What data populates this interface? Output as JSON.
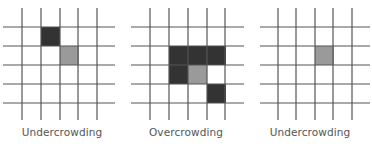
{
  "colors": {
    "grid_line": "#555555",
    "live_cell": "#333333",
    "focus_cell": "#9a9a9a",
    "background": "#ffffff",
    "caption": "#555555"
  },
  "grid": {
    "rows": 5,
    "cols": 5,
    "cell_size": 19
  },
  "panels": [
    {
      "caption": "Undercrowding",
      "offset_x": 0,
      "vlines_x": [
        22,
        41,
        60,
        78,
        97
      ],
      "hline_x_range": [
        3,
        115
      ],
      "cells": [
        {
          "x": 41,
          "y": 27,
          "type": "live"
        },
        {
          "x": 60,
          "y": 46,
          "type": "focus"
        }
      ]
    },
    {
      "caption": "Overcrowding",
      "offset_x": 124,
      "vlines_x": [
        150,
        169,
        188,
        207,
        225
      ],
      "hline_x_range": [
        131,
        244
      ],
      "cells": [
        {
          "x": 169,
          "y": 46,
          "type": "live"
        },
        {
          "x": 188,
          "y": 46,
          "type": "live"
        },
        {
          "x": 207,
          "y": 46,
          "type": "live"
        },
        {
          "x": 169,
          "y": 65,
          "type": "live"
        },
        {
          "x": 188,
          "y": 65,
          "type": "focus"
        },
        {
          "x": 207,
          "y": 84,
          "type": "live"
        }
      ]
    },
    {
      "caption": "Undercrowding",
      "offset_x": 248,
      "vlines_x": [
        278,
        296,
        315,
        333,
        352
      ],
      "hline_x_range": [
        260,
        370
      ],
      "cells": [
        {
          "x": 315,
          "y": 46,
          "type": "focus"
        }
      ]
    }
  ],
  "hlines_y": [
    27,
    46,
    65,
    84,
    103
  ],
  "vline_y_range": [
    8,
    120
  ]
}
